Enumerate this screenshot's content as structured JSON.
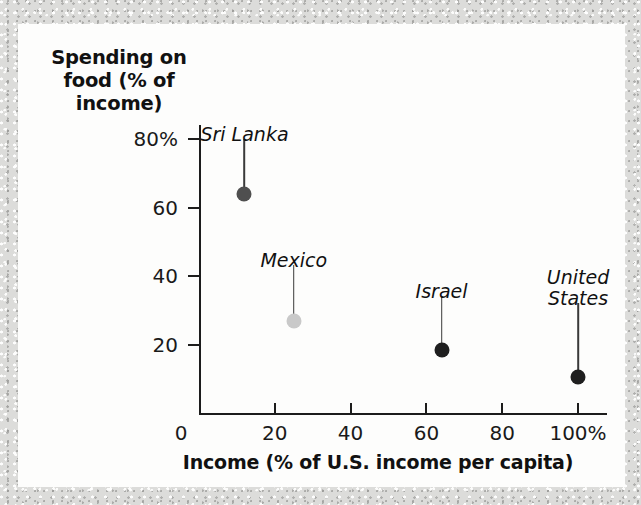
{
  "chart_data": {
    "type": "scatter",
    "title": "",
    "xlabel": "Income (% of U.S. income per capita)",
    "ylabel": "Spending on food (% of income)",
    "ylabel_lines": [
      "Spending on",
      "food (% of",
      "income)"
    ],
    "xlim": [
      0,
      107
    ],
    "ylim": [
      0,
      88
    ],
    "grid": false,
    "legend": "none",
    "x_ticks": [
      {
        "value": 0,
        "label": "0"
      },
      {
        "value": 20,
        "label": "20"
      },
      {
        "value": 40,
        "label": "40"
      },
      {
        "value": 60,
        "label": "60"
      },
      {
        "value": 80,
        "label": "80"
      },
      {
        "value": 100,
        "label": "100%"
      }
    ],
    "y_ticks": [
      {
        "value": 20,
        "label": "20"
      },
      {
        "value": 40,
        "label": "40"
      },
      {
        "value": 60,
        "label": "60"
      },
      {
        "value": 80,
        "label": "80%"
      }
    ],
    "points": [
      {
        "name": "Sri Lanka",
        "label": "Sri Lanka",
        "x": 12,
        "y": 64,
        "color": "#4f4f4f",
        "label_y": 82,
        "label_lines": 1
      },
      {
        "name": "Mexico",
        "label": "Mexico",
        "x": 25,
        "y": 27,
        "color": "#c9c9c9",
        "label_y": 45,
        "label_lines": 1
      },
      {
        "name": "Israel",
        "label": "Israel",
        "x": 64,
        "y": 18.5,
        "color": "#1f1f1f",
        "label_y": 36,
        "label_lines": 1
      },
      {
        "name": "United States",
        "label": "United\nStates",
        "x": 100,
        "y": 10.5,
        "color": "#1f1f1f",
        "label_y": 34,
        "label_lines": 2
      }
    ]
  }
}
